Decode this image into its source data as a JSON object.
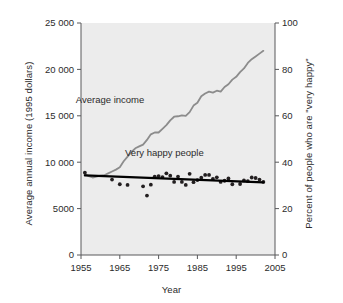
{
  "chart_data": {
    "type": "line",
    "title": "",
    "xlabel": "Year",
    "ylabel": "Average annual income (1995 dollars)",
    "ylabel_right": "Percent of people who are \"very happy\"",
    "xlim": [
      1955,
      2005
    ],
    "ylim": [
      0,
      25000
    ],
    "ylim_right": [
      0,
      100
    ],
    "xticks": [
      "1955",
      "1965",
      "1975",
      "1985",
      "1995",
      "2005"
    ],
    "xtick_values": [
      1955,
      1965,
      1975,
      1985,
      1995,
      2005
    ],
    "yticks_left": [
      "0",
      "5000",
      "10 000",
      "15 000",
      "20 000",
      "25 000"
    ],
    "ytick_values_left": [
      0,
      5000,
      10000,
      15000,
      20000,
      25000
    ],
    "yticks_right": [
      "0",
      "20",
      "40",
      "60",
      "80",
      "100"
    ],
    "ytick_values_right": [
      0,
      20,
      40,
      60,
      80,
      100
    ],
    "grid": false,
    "legend_position": "inline-annotations",
    "plot_background_color": "#ececec",
    "series": [
      {
        "name": "Average income",
        "type": "line",
        "axis": "left",
        "color": "#8c8c8c",
        "label_annotation": "Average income",
        "x": [
          1956,
          1957,
          1958,
          1959,
          1960,
          1961,
          1962,
          1963,
          1964,
          1965,
          1966,
          1967,
          1968,
          1969,
          1970,
          1971,
          1972,
          1973,
          1974,
          1975,
          1976,
          1977,
          1978,
          1979,
          1980,
          1981,
          1982,
          1983,
          1984,
          1985,
          1986,
          1987,
          1988,
          1989,
          1990,
          1991,
          1992,
          1993,
          1994,
          1995,
          1996,
          1997,
          1998,
          1999,
          2000,
          2001,
          2002
        ],
        "y": [
          8700,
          8500,
          8350,
          8450,
          8550,
          8600,
          8800,
          9000,
          9200,
          9450,
          10100,
          10600,
          11100,
          11500,
          11700,
          11900,
          12400,
          13000,
          13200,
          13200,
          13600,
          14000,
          14500,
          14900,
          14950,
          15050,
          15000,
          15400,
          16100,
          16400,
          17100,
          17400,
          17600,
          17500,
          17700,
          17600,
          18100,
          18400,
          18900,
          19200,
          19700,
          20100,
          20700,
          21100,
          21400,
          21700,
          22000
        ]
      },
      {
        "name": "Very happy people",
        "type": "scatter",
        "axis": "right",
        "color": "#231f20",
        "label_annotation": "Very happy people",
        "x": [
          1956,
          1963,
          1965,
          1967,
          1971,
          1972,
          1973,
          1974,
          1975,
          1976,
          1977,
          1978,
          1979,
          1980,
          1981,
          1982,
          1983,
          1984,
          1985,
          1986,
          1987,
          1988,
          1989,
          1990,
          1991,
          1992,
          1993,
          1994,
          1996,
          1997,
          1998,
          1999,
          2000,
          2001,
          2002
        ],
        "y": [
          35.5,
          32.5,
          30.5,
          30.2,
          29.6,
          25.6,
          30.3,
          33.8,
          34.0,
          33.6,
          35.2,
          34.2,
          31.5,
          33.8,
          31.5,
          30.2,
          35.0,
          31.4,
          32.3,
          33.3,
          34.5,
          34.5,
          32.8,
          33.5,
          31.5,
          32.0,
          33.0,
          30.5,
          30.6,
          32.2,
          31.8,
          33.4,
          33.2,
          32.5,
          31.5
        ]
      },
      {
        "name": "Very happy people trend line",
        "type": "line",
        "axis": "right",
        "color": "#000000",
        "x": [
          1956,
          2002
        ],
        "y": [
          34.3,
          31.3
        ]
      }
    ],
    "annotations": [
      {
        "text": "Average income",
        "x": 1962.5,
        "y": 16400,
        "axis": "left"
      },
      {
        "text": "Very happy people",
        "x": 1976.5,
        "y": 10700,
        "axis": "left"
      }
    ]
  }
}
